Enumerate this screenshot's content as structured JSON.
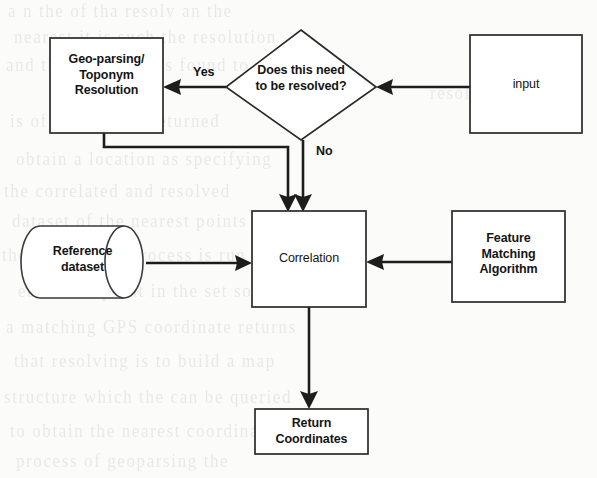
{
  "diagram": {
    "type": "flowchart",
    "background_color": "#fbfbfa",
    "stroke_color": "#1d1d1d",
    "fill_color": "#ffffff"
  },
  "nodes": {
    "geo_parsing": {
      "shape": "process",
      "line1": "Geo-parsing/",
      "line2": "Toponym",
      "line3": "Resolution"
    },
    "decision": {
      "shape": "diamond",
      "line1": "Does this need",
      "line2": "to be resolved?"
    },
    "input": {
      "shape": "process",
      "label": "input"
    },
    "reference_dataset": {
      "shape": "cylinder",
      "line1": "Reference",
      "line2": "dataset"
    },
    "correlation": {
      "shape": "process",
      "label": "Correlation"
    },
    "feature_matching": {
      "shape": "process",
      "line1": "Feature",
      "line2": "Matching",
      "line3": "Algorithm"
    },
    "return_coordinates": {
      "shape": "process",
      "line1": "Return",
      "line2": "Coordinates"
    }
  },
  "edges": [
    {
      "id": "input-to-decision",
      "from": "input",
      "to": "decision",
      "label": ""
    },
    {
      "id": "decision-to-geo-parsing",
      "from": "decision",
      "to": "geo_parsing",
      "label": "Yes"
    },
    {
      "id": "decision-to-correlation",
      "from": "decision",
      "to": "correlation",
      "label": "No"
    },
    {
      "id": "geo-parsing-to-correlation",
      "from": "geo_parsing",
      "to": "correlation",
      "label": ""
    },
    {
      "id": "reference-to-correlation",
      "from": "reference_dataset",
      "to": "correlation",
      "label": ""
    },
    {
      "id": "feature-matching-to-correlation",
      "from": "feature_matching",
      "to": "correlation",
      "label": ""
    },
    {
      "id": "correlation-to-return",
      "from": "correlation",
      "to": "return_coordinates",
      "label": ""
    }
  ],
  "edge_labels": {
    "yes": "Yes",
    "no": "No"
  },
  "ghost_text": {
    "lines": [
      "a n  the  of  tha  resolv  an  the",
      "nearest  it  is  such  the  resolution",
      "and  the  input  that  is  found  to",
      "resolve",
      "is  of  the  t  in  the  returned",
      "obtain  a  location  as  specifying",
      "the  correlated  and  resolved",
      "dataset  of  the  nearest  points",
      "the  correlation  process  is  run",
      "each  data  point  in  the  set  so",
      "a  matching  GPS  coordinate  returns",
      "that  resolving  is  to  build  a  map",
      "structure  which  the  can  be  queried",
      "to  obtain  the  nearest  coordinates",
      "process  of  geoparsing  the"
    ]
  }
}
